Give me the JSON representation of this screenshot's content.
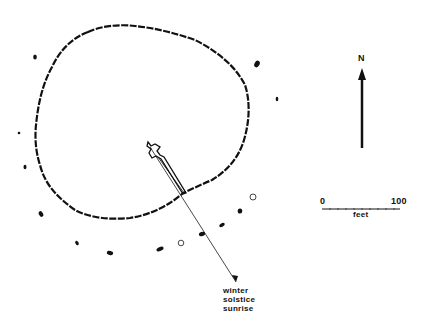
{
  "diagram": {
    "type": "site-plan",
    "north_label": "N",
    "scale": {
      "start": "0",
      "end": "100",
      "unit": "feet"
    },
    "annotation": [
      "winter",
      "solstice",
      "sunrise"
    ],
    "colors": {
      "ink": "#111111",
      "background": "#ffffff"
    },
    "stones_filled": [
      [
        35,
        57
      ],
      [
        257,
        64
      ],
      [
        277,
        99
      ],
      [
        19,
        133
      ],
      [
        25,
        167
      ],
      [
        41,
        214
      ],
      [
        240,
        211
      ],
      [
        222,
        225
      ],
      [
        202,
        234
      ],
      [
        160,
        249
      ],
      [
        110,
        253
      ],
      [
        77,
        243
      ]
    ],
    "stones_open": [
      [
        253,
        197
      ],
      [
        181,
        243
      ]
    ]
  }
}
